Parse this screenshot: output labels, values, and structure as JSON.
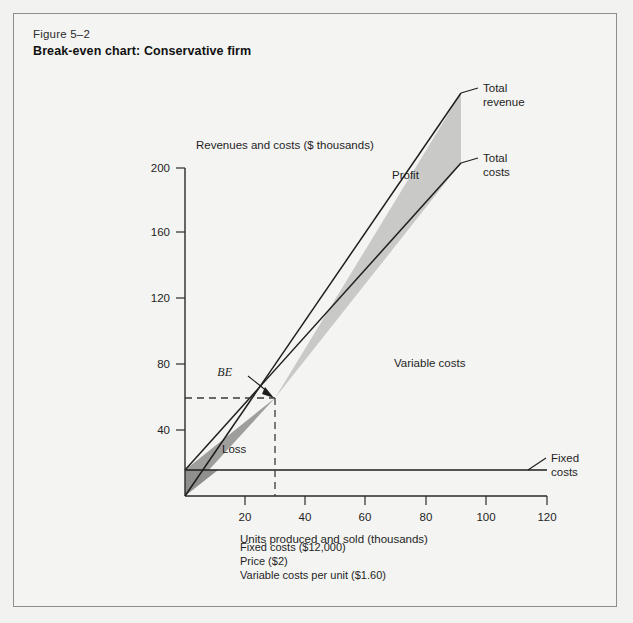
{
  "figure": {
    "number": "Figure 5–2",
    "title": "Break-even chart: Conservative firm"
  },
  "chart_data": {
    "type": "line",
    "title": "Break-even chart: Conservative firm",
    "xlabel": "Units produced and sold (thousands)",
    "ylabel": "Revenues and costs ($ thousands)",
    "xlim": [
      0,
      125
    ],
    "ylim": [
      0,
      208
    ],
    "xticks": [
      20,
      40,
      60,
      80,
      100,
      120
    ],
    "yticks": [
      40,
      80,
      120,
      160,
      200
    ],
    "xtick_labels": [
      "20",
      "40",
      "60",
      "80",
      "100",
      "120"
    ],
    "ytick_labels": [
      "40",
      "80",
      "120",
      "160",
      "200"
    ],
    "grid": false,
    "legend_position": "inline-labels",
    "series": [
      {
        "name": "Total revenue",
        "slope_per_unit": 2,
        "intercept": 0,
        "x": [
          0,
          120
        ],
        "values": [
          0,
          240
        ]
      },
      {
        "name": "Total costs",
        "slope_per_unit": 1.6,
        "intercept": 12,
        "x": [
          0,
          120
        ],
        "values": [
          12,
          204
        ]
      },
      {
        "name": "Fixed costs",
        "slope_per_unit": 0,
        "intercept": 12,
        "x": [
          0,
          120
        ],
        "values": [
          12,
          12
        ]
      }
    ],
    "break_even": {
      "label": "BE",
      "units_thousands": 30,
      "dollars_thousands": 60
    },
    "regions": [
      {
        "name": "Loss",
        "label": "Loss"
      },
      {
        "name": "Profit",
        "label": "Profit"
      },
      {
        "name": "Variable costs",
        "label": "Variable costs"
      }
    ],
    "annotations": [
      "Fixed costs ($12,000)",
      "Price ($2)",
      "Variable costs per unit ($1.60)"
    ]
  },
  "axes": {
    "y_title": "Revenues and costs ($ thousands)",
    "x_title": "Units produced and sold (thousands)",
    "y_ticks": [
      "200",
      "160",
      "120",
      "80",
      "40"
    ],
    "x_ticks": [
      "20",
      "40",
      "60",
      "80",
      "100",
      "120"
    ]
  },
  "labels": {
    "total_revenue_line1": "Total",
    "total_revenue_line2": "revenue",
    "total_costs_line1": "Total",
    "total_costs_line2": "costs",
    "fixed_costs_line1": "Fixed",
    "fixed_costs_line2": "costs",
    "profit": "Profit",
    "loss": "Loss",
    "variable_costs": "Variable costs",
    "break_even": "BE"
  },
  "footnotes": {
    "line1": "Fixed costs ($12,000)",
    "line2": "Price ($2)",
    "line3": "Variable costs per unit ($1.60)"
  },
  "colors": {
    "page_background": "#f2f2f0",
    "panel_background": "#f4f4f2",
    "border": "#8d8d8d",
    "ink": "#1f1f1f",
    "profit_fill": "#c9c9c7",
    "loss_fill": "#9e9e9c"
  }
}
